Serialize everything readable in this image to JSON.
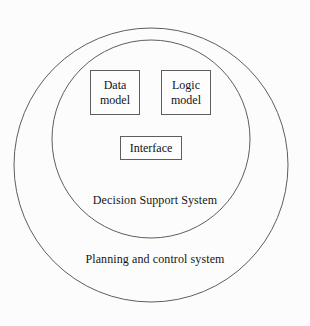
{
  "diagram": {
    "background_color": "#fcfcfc",
    "stroke_color": "#5e5e5e",
    "text_color": "#121212",
    "outer_ring": {
      "label": "Planning and control system",
      "shape": "circle",
      "center_x": 151,
      "center_y": 165,
      "radius": 137
    },
    "inner_ring": {
      "label": "Decision Support System",
      "shape": "circle",
      "center_x": 151,
      "center_y": 139,
      "radius": 99
    },
    "boxes": [
      {
        "id": "data-model",
        "label": "Data\nmodel",
        "x": 90,
        "y": 70,
        "width": 50,
        "height": 45
      },
      {
        "id": "logic-model",
        "label": "Logic\nmodel",
        "x": 161,
        "y": 70,
        "width": 50,
        "height": 45
      },
      {
        "id": "interface",
        "label": "Interface",
        "x": 120,
        "y": 136,
        "width": 62,
        "height": 24
      }
    ]
  }
}
